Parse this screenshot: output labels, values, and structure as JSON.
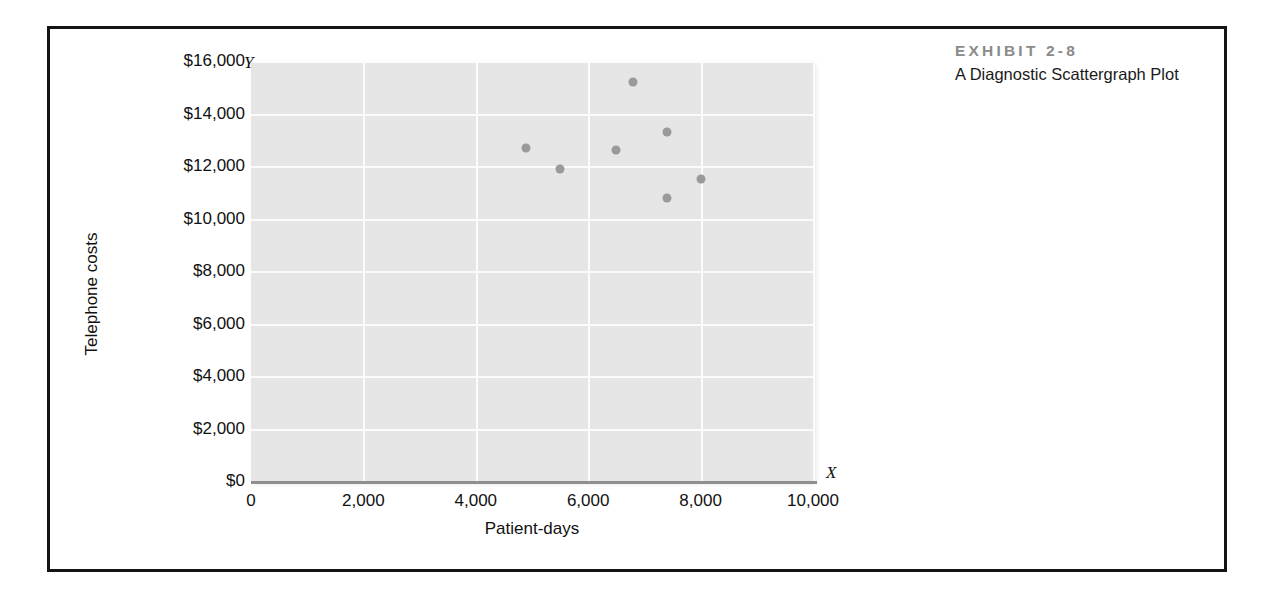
{
  "exhibit": {
    "number": "EXHIBIT 2-8",
    "subtitle": "A Diagnostic Scattergraph Plot"
  },
  "axis_marks": {
    "y": "Y",
    "x": "X"
  },
  "colors": {
    "plot_background": "#e9e9e9",
    "gridline": "#fbfbfb",
    "point": "#9a9a9a",
    "axis": "#8f8f8f",
    "exhibit_number": "#8a8a8a",
    "text": "#111111",
    "frame": "#141414"
  },
  "chart_data": {
    "type": "scatter",
    "title": "A Diagnostic Scattergraph Plot",
    "xlabel": "Patient-days",
    "ylabel": "Telephone costs",
    "xlim": [
      0,
      10000
    ],
    "ylim": [
      0,
      16000
    ],
    "grid": true,
    "legend": null,
    "xticks": [
      0,
      2000,
      4000,
      6000,
      8000,
      10000
    ],
    "xticklabels": [
      "0",
      "2,000",
      "4,000",
      "6,000",
      "8,000",
      "10,000"
    ],
    "yticks": [
      0,
      2000,
      4000,
      6000,
      8000,
      10000,
      12000,
      14000,
      16000
    ],
    "yticklabels": [
      "$0",
      "$2,000",
      "$4,000",
      "$6,000",
      "$8,000",
      "$10,000",
      "$12,000",
      "$14,000",
      "$16,000"
    ],
    "points": [
      {
        "x": 4900,
        "y": 12700
      },
      {
        "x": 5500,
        "y": 11900
      },
      {
        "x": 6500,
        "y": 12600
      },
      {
        "x": 6800,
        "y": 15200
      },
      {
        "x": 7400,
        "y": 13300
      },
      {
        "x": 7400,
        "y": 10800
      },
      {
        "x": 8000,
        "y": 11500
      }
    ]
  }
}
